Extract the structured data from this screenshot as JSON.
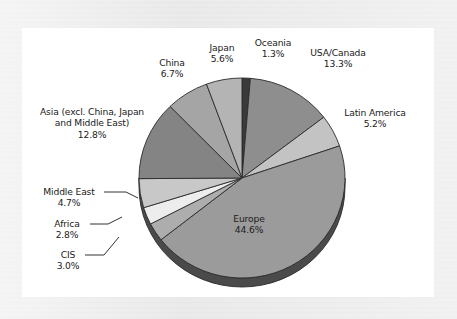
{
  "chart_data": {
    "type": "pie",
    "title": "",
    "subtitle": "",
    "xlabel": "",
    "ylabel": "",
    "legend_position": "none",
    "grid": false,
    "value_suffix": "%",
    "total": 100.0,
    "start_angle_deg": -90,
    "direction": "clockwise",
    "categories": [
      "Oceania",
      "USA/Canada",
      "Latin America",
      "Europe",
      "CIS",
      "Africa",
      "Middle East",
      "Asia (excl. China, Japan and Middle East)",
      "China",
      "Japan"
    ],
    "values": [
      1.3,
      13.3,
      5.2,
      44.6,
      3.0,
      2.8,
      4.7,
      12.8,
      6.7,
      5.6
    ],
    "slices": [
      {
        "label": "Oceania",
        "value": 1.3,
        "value_text": "1.3%",
        "color": "#3a3a3a"
      },
      {
        "label": "USA/Canada",
        "value": 13.3,
        "value_text": "13.3%",
        "color": "#8e8e8e"
      },
      {
        "label": "Latin America",
        "value": 5.2,
        "value_text": "5.2%",
        "color": "#c3c3c3"
      },
      {
        "label": "Europe",
        "value": 44.6,
        "value_text": "44.6%",
        "color": "#9b9b9b"
      },
      {
        "label": "CIS",
        "value": 3.0,
        "value_text": "3.0%",
        "color": "#adadad"
      },
      {
        "label": "Africa",
        "value": 2.8,
        "value_text": "2.8%",
        "color": "#ededed"
      },
      {
        "label": "Middle East",
        "value": 4.7,
        "value_text": "4.7%",
        "color": "#c8c8c8"
      },
      {
        "label": "Asia (excl. China, Japan and Middle East)",
        "value": 12.8,
        "value_text": "12.8%",
        "color": "#848484"
      },
      {
        "label": "China",
        "value": 6.7,
        "value_text": "6.7%",
        "color": "#a5a5a5"
      },
      {
        "label": "Japan",
        "value": 5.6,
        "value_text": "5.6%",
        "color": "#b4b4b4"
      }
    ],
    "labels": [
      {
        "name": "Japan",
        "value_text": "5.6%"
      },
      {
        "name": "Oceania",
        "value_text": "1.3%"
      },
      {
        "name": "China",
        "value_text": "6.7%"
      },
      {
        "name": "USA/Canada",
        "value_text": "13.3%"
      },
      {
        "name": "Latin America",
        "value_text": "5.2%"
      },
      {
        "name": "Asia (excl. China, Japan and Middle East)",
        "value_text": "12.8%"
      },
      {
        "name": "Middle East",
        "value_text": "4.7%"
      },
      {
        "name": "Africa",
        "value_text": "2.8%"
      },
      {
        "name": "CIS",
        "value_text": "3.0%"
      },
      {
        "name": "Europe",
        "value_text": "44.6%"
      }
    ]
  },
  "labels": {
    "japan": {
      "name": "Japan",
      "value": "5.6%"
    },
    "oceania": {
      "name": "Oceania",
      "value": "1.3%"
    },
    "china": {
      "name": "China",
      "value": "6.7%"
    },
    "usa_canada": {
      "name": "USA/Canada",
      "value": "13.3%"
    },
    "latin_america": {
      "name": "Latin America",
      "value": "5.2%"
    },
    "asia": {
      "name_line1": "Asia (excl. China, Japan",
      "name_line2": "and Middle East)",
      "value": "12.8%"
    },
    "middle_east": {
      "name": "Middle East",
      "value": "4.7%"
    },
    "africa": {
      "name": "Africa",
      "value": "2.8%"
    },
    "cis": {
      "name": "CIS",
      "value": "3.0%"
    },
    "europe": {
      "name": "Europe",
      "value": "44.6%"
    }
  },
  "style": {
    "page_background": "#e8e8e8",
    "plot_background": "#ffffff",
    "text_color": "#1b1b1b",
    "slice_outline": "#2b2b2b",
    "depth_shadow": "#4a4a4a",
    "leader_line": "#1b1b1b"
  }
}
